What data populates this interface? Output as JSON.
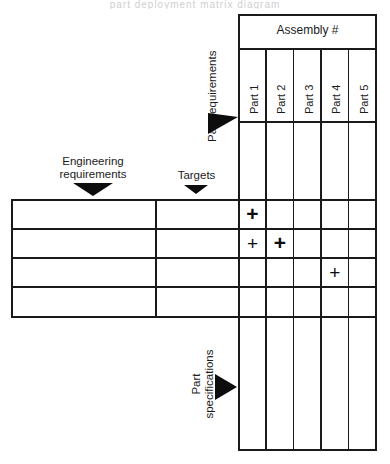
{
  "diagram": {
    "title_clipped": "part deployment matrix diagram",
    "assembly_header": "Assembly #",
    "part_columns": [
      "Part 1",
      "Part 2",
      "Part 3",
      "Part 4",
      "Part 5"
    ],
    "flow_labels": {
      "engineering_requirements": "Engineering requirements",
      "engineering_requirements_line1": "Engineering",
      "engineering_requirements_line2": "requirements",
      "targets": "Targets",
      "part_requirements": "Part requirements",
      "part_specifications": "Part specifications",
      "part_specifications_line1": "Part",
      "part_specifications_line2": "specifications"
    },
    "left_table": {
      "column_headers": [
        "Engineering requirements",
        "Targets"
      ],
      "rows": [
        {
          "requirement": "",
          "target": ""
        },
        {
          "requirement": "",
          "target": ""
        },
        {
          "requirement": "",
          "target": ""
        },
        {
          "requirement": "",
          "target": ""
        }
      ]
    },
    "matrix": {
      "row_count": 4,
      "column_count": 5,
      "marks": [
        {
          "row": 1,
          "column": 1,
          "symbol": "+",
          "weight": "strong"
        },
        {
          "row": 2,
          "column": 1,
          "symbol": "+",
          "weight": "light"
        },
        {
          "row": 2,
          "column": 2,
          "symbol": "+",
          "weight": "strong"
        },
        {
          "row": 3,
          "column": 4,
          "symbol": "+",
          "weight": "light"
        }
      ]
    },
    "colors": {
      "line": "#1a1a1a",
      "arrow": "#0d0d0d",
      "text": "#1b1b1b",
      "background": "#ffffff"
    }
  }
}
